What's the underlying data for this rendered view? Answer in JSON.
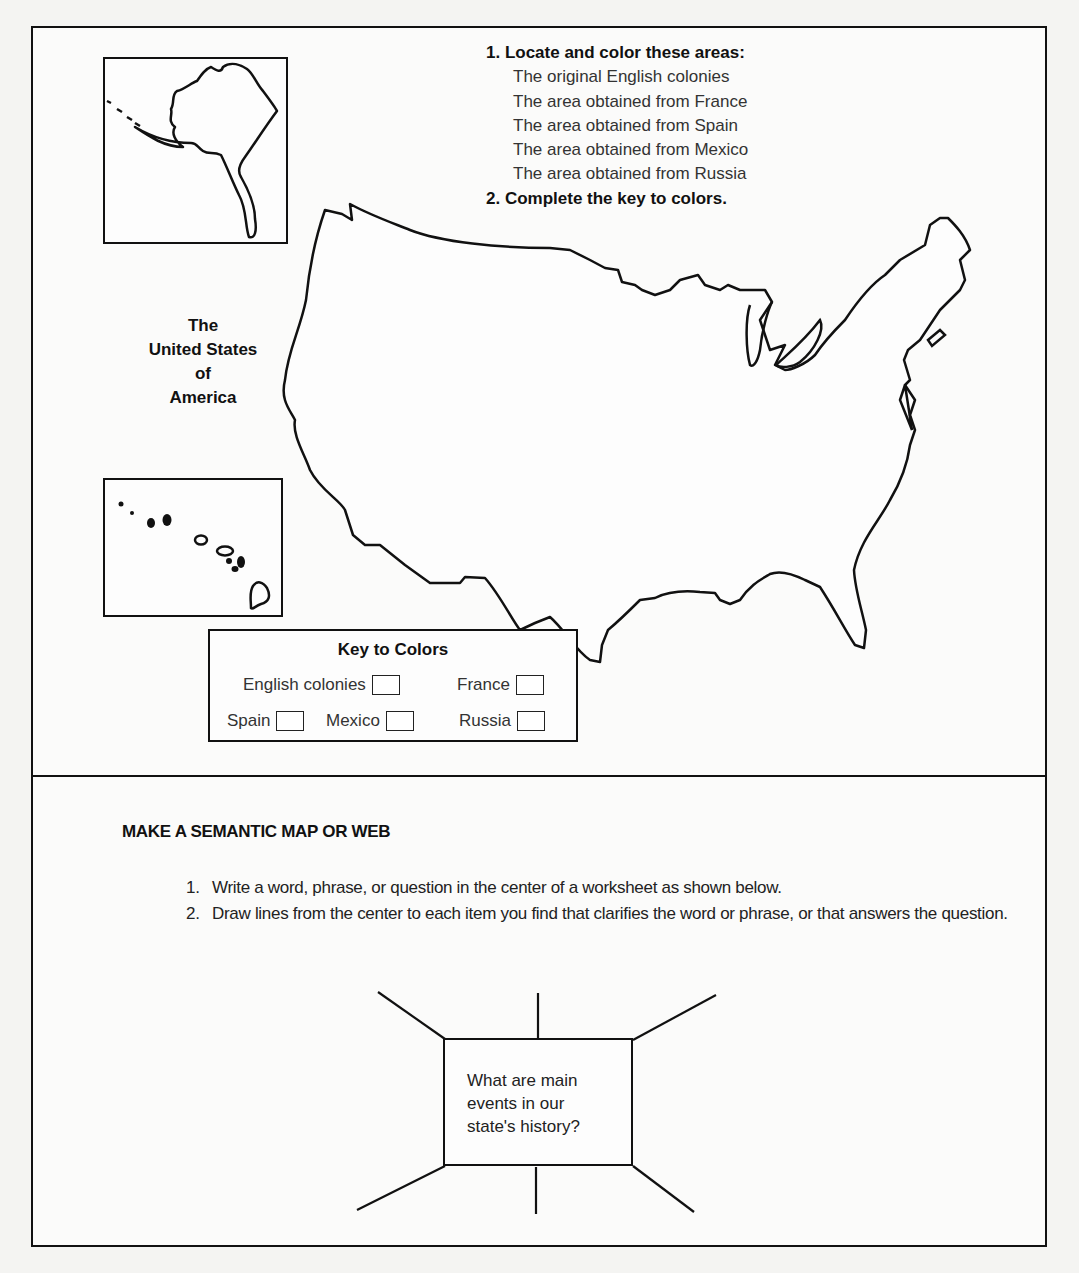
{
  "instructions": {
    "step1_label": "1. Locate and color these areas:",
    "areas": [
      "The original English colonies",
      "The area obtained from France",
      "The area obtained from Spain",
      "The area obtained from Mexico",
      "The area obtained from Russia"
    ],
    "step2_label": "2. Complete the key to colors."
  },
  "map": {
    "title_lines": [
      "The",
      "United States",
      "of",
      "America"
    ]
  },
  "key": {
    "title": "Key to Colors",
    "items": [
      {
        "label": "English colonies"
      },
      {
        "label": "France"
      },
      {
        "label": "Spain"
      },
      {
        "label": "Mexico"
      },
      {
        "label": "Russia"
      }
    ]
  },
  "semantic_map": {
    "title": "MAKE A SEMANTIC MAP OR WEB",
    "steps": [
      {
        "num": "1.",
        "text": "Write a word, phrase, or question in the center of a worksheet as shown below."
      },
      {
        "num": "2.",
        "text": "Draw lines from the center to each item you find that clarifies the word or phrase, or that answers the question."
      }
    ],
    "center_text_lines": [
      "What are main",
      "events in our",
      "state's history?"
    ]
  }
}
